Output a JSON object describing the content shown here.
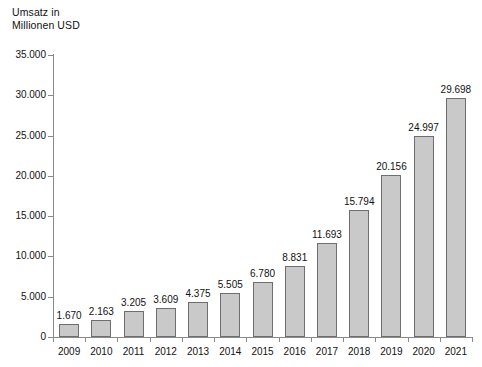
{
  "chart_data": {
    "type": "bar",
    "title_line1": "Umsatz in",
    "title_line2": "Millionen USD",
    "xlabel": "",
    "ylabel": "Umsatz in Millionen USD",
    "ylim": [
      0,
      35000
    ],
    "grid": false,
    "legend": "none",
    "locale_decimal_separator": ",",
    "locale_thousands_separator": ".",
    "categories": [
      "2009",
      "2010",
      "2011",
      "2012",
      "2013",
      "2014",
      "2015",
      "2016",
      "2017",
      "2018",
      "2019",
      "2020",
      "2021"
    ],
    "values": [
      1670,
      2163,
      3205,
      3609,
      4375,
      5505,
      6780,
      8831,
      11693,
      15794,
      20156,
      24997,
      29698
    ],
    "value_labels": [
      "1.670",
      "2.163",
      "3.205",
      "3.609",
      "4.375",
      "5.505",
      "6.780",
      "8.831",
      "11.693",
      "15.794",
      "20.156",
      "24.997",
      "29.698"
    ],
    "ytick_values": [
      0,
      5000,
      10000,
      15000,
      20000,
      25000,
      30000,
      35000
    ],
    "ytick_labels": [
      "0",
      "5.000",
      "10.000",
      "15.000",
      "20.000",
      "25.000",
      "30.000",
      "35.000"
    ],
    "colors": {
      "background": "#ffffff",
      "bar_fill": "#c9c9c9",
      "bar_border": "#6e6e6e",
      "axis": "#8a8a8a",
      "text": "#111111"
    }
  }
}
